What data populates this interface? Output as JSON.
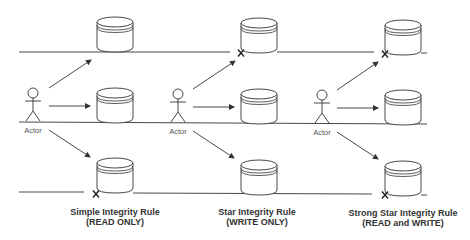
{
  "diagram": {
    "colors": {
      "stroke": "#333333",
      "text": "#333333",
      "label": "#555555",
      "background": "#ffffff"
    },
    "panels": [
      {
        "actor_label": "Actor",
        "caption_title": "Simple Integrity Rule",
        "caption_subtitle": "(READ ONLY)",
        "blocked_levels": [
          "bottom"
        ],
        "arrows": [
          "up",
          "level",
          "down"
        ]
      },
      {
        "actor_label": "Actor",
        "caption_title": "Star Integrity Rule",
        "caption_subtitle": "(WRITE ONLY)",
        "blocked_levels": [
          "top"
        ],
        "arrows": [
          "up",
          "level",
          "down"
        ]
      },
      {
        "actor_label": "Actor",
        "caption_title": "Strong Star Integrity Rule",
        "caption_subtitle": "(READ and WRITE)",
        "blocked_levels": [
          "top",
          "bottom"
        ],
        "arrows": [
          "up",
          "level",
          "down"
        ]
      }
    ],
    "icons": {
      "actor": "stick-figure-icon",
      "database": "database-cylinder-icon",
      "blocked": "x-mark-icon",
      "arrow": "arrow-right-icon"
    }
  }
}
